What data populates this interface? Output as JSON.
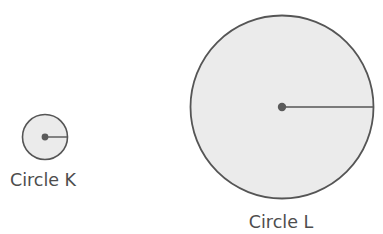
{
  "diagram": {
    "background_color": "#ffffff",
    "stroke_color": "#555555",
    "fill_color": "#ebebeb",
    "dot_color": "#5a5a5a",
    "label_color": "#4d4d4d",
    "figures": [
      {
        "id": "circle-k",
        "label": "Circle K",
        "center_x": 45,
        "center_y": 137,
        "radius": 22.5,
        "stroke_width": 1.6,
        "dot_radius": 3.4,
        "radius_line_width": 1.4,
        "label_x": 43,
        "label_y": 186,
        "label_font_size": 17.5
      },
      {
        "id": "circle-l",
        "label": "Circle L",
        "center_x": 282,
        "center_y": 107,
        "radius": 91.5,
        "stroke_width": 1.8,
        "dot_radius": 4.2,
        "radius_line_width": 1.5,
        "label_x": 281,
        "label_y": 228,
        "label_font_size": 17.5
      }
    ]
  }
}
